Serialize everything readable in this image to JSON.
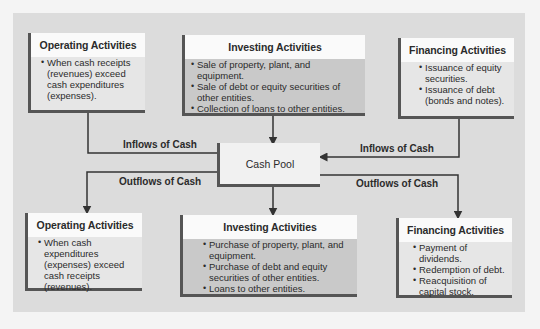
{
  "diagram": {
    "inflow_sources": [
      {
        "title": "Operating Activities",
        "items": [
          "When cash receipts (revenues) exceed cash expenditures (expenses)."
        ]
      },
      {
        "title": "Investing Activities",
        "items": [
          "Sale of property, plant, and equipment.",
          "Sale of debt or equity securities of other entities.",
          "Collection of loans to other entities."
        ]
      },
      {
        "title": "Financing Activities",
        "items": [
          "Issuance of equity securities.",
          "Issuance of debt (bonds and notes)."
        ]
      }
    ],
    "center": {
      "label": "Cash Pool"
    },
    "flow_labels": {
      "inflows_left": "Inflows of Cash",
      "inflows_right": "Inflows of Cash",
      "outflows_left": "Outflows of Cash",
      "outflows_right": "Outflows of Cash"
    },
    "outflow_uses": [
      {
        "title": "Operating Activities",
        "items": [
          "When cash expenditures (expenses) exceed cash receipts (revenues)."
        ]
      },
      {
        "title": "Investing Activities",
        "items": [
          "Purchase of property, plant, and equipment.",
          "Purchase of debt and equity securities of other entities.",
          "Loans to other entities."
        ]
      },
      {
        "title": "Financing Activities",
        "items": [
          "Payment of dividends.",
          "Redemption of debt.",
          "Reacquisition of capital stock."
        ]
      }
    ]
  }
}
